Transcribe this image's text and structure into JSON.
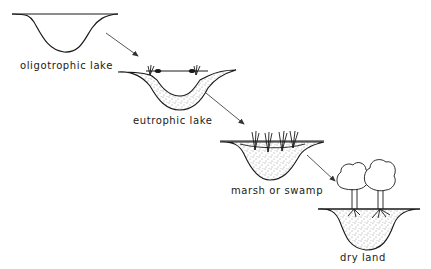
{
  "diagram": {
    "type": "lake succession sequence",
    "stages": [
      {
        "id": "oligotrophic",
        "label": "oligotrophic lake"
      },
      {
        "id": "eutrophic",
        "label": "eutrophic lake"
      },
      {
        "id": "marsh",
        "label": "marsh or swamp"
      },
      {
        "id": "dry",
        "label": "dry land"
      }
    ],
    "arrows": [
      {
        "from": "oligotrophic",
        "to": "eutrophic"
      },
      {
        "from": "eutrophic",
        "to": "marsh"
      },
      {
        "from": "marsh",
        "to": "dry"
      }
    ],
    "colors": {
      "ink": "#1a1a1a",
      "arrow": "#444444",
      "background": "#ffffff"
    }
  }
}
